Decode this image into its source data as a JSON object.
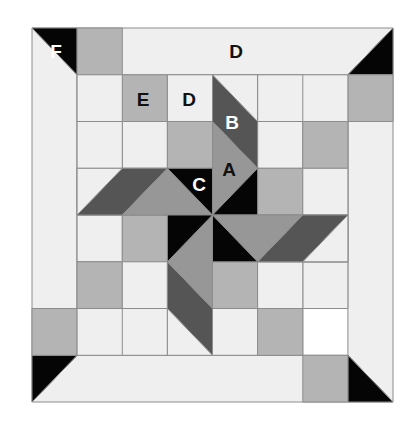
{
  "diagram": {
    "type": "quilt-block",
    "grid": {
      "columns": 8,
      "rows": 8,
      "left": 32,
      "top": 28,
      "right": 393,
      "bottom": 402
    },
    "colors": {
      "light": "#efefef",
      "medium": "#b4b4b4",
      "gray": "#979797",
      "dark": "#555555",
      "black": "#050505",
      "line": "#8c8c8c"
    },
    "labels": {
      "F": "F",
      "D_border": "D",
      "E": "E",
      "D_inner": "D",
      "B": "B",
      "A": "A",
      "C": "C"
    }
  }
}
